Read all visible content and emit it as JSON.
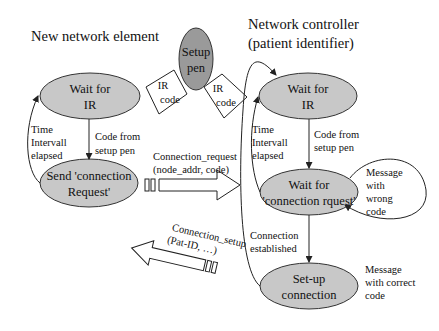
{
  "diagram": {
    "left_title": "New network element",
    "right_title_line1": "Network controller",
    "right_title_line2": "(patient identifier)",
    "setup_pen": {
      "line1": "Setup",
      "line2": "pen"
    },
    "ir_code_left": {
      "line1": "IR",
      "line2": "code"
    },
    "ir_code_right": {
      "line1": "IR",
      "line2": "code"
    },
    "left_states": [
      {
        "line1": "Wait for",
        "line2": "IR"
      },
      {
        "line1": "Send 'connection",
        "line2": "Request'"
      }
    ],
    "right_states": [
      {
        "line1": "Wait for",
        "line2": "IR"
      },
      {
        "line1": "Wait for",
        "line2": "'connection rquest'"
      },
      {
        "line1": "Set-up",
        "line2": "connection"
      }
    ],
    "left_transitions": {
      "code_from_pen": {
        "line1": "Code from",
        "line2": "setup pen"
      },
      "timeout": {
        "line1": "Time",
        "line2": "Intervall",
        "line3": "elapsed"
      }
    },
    "right_transitions": {
      "code_from_pen": {
        "line1": "Code from",
        "line2": "setup pen"
      },
      "timeout": {
        "line1": "Time",
        "line2": "Intervall",
        "line3": "elapsed"
      },
      "wrong_code": {
        "line1": "Message",
        "line2": "with",
        "line3": "wrong",
        "line4": "code"
      },
      "established": {
        "line1": "Connection",
        "line2": "established"
      },
      "correct_code": {
        "line1": "Message",
        "line2": "with correct",
        "line3": "code"
      }
    },
    "messages": {
      "request": {
        "line1": "Connection_request",
        "line2": "(node_addr, code)"
      },
      "setup": {
        "line1": "Connection_setup",
        "line2": "(Pat-ID, …)"
      }
    },
    "colors": {
      "state_fill": "#c8c8c8",
      "pen_fill": "#9a9a9a",
      "stroke": "#333333"
    }
  }
}
